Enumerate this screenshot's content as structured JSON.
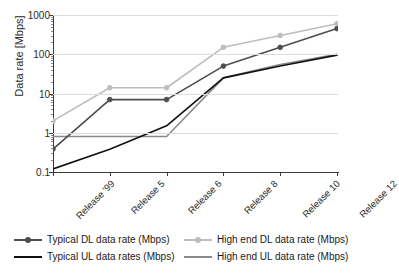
{
  "chart_data": {
    "type": "line",
    "title": "",
    "xlabel": "",
    "ylabel": "Data rate [Mbps]",
    "categories": [
      "Release '99",
      "Release 5",
      "Release 6",
      "Release 8",
      "Release 10",
      "Release 12"
    ],
    "yscale": "log",
    "ylim": [
      0.1,
      1000
    ],
    "yticks": [
      0.1,
      1,
      10,
      100,
      1000
    ],
    "ytick_labels": [
      "0.1",
      "1",
      "10",
      "100",
      "1000"
    ],
    "grid": true,
    "legend_position": "below",
    "series": [
      {
        "name": "Typical DL data rate (Mbps)",
        "color": "#4d4d4d",
        "marker": "circle",
        "values": [
          0.384,
          7,
          7,
          50,
          150,
          450
        ]
      },
      {
        "name": "Typical UL data rates (Mbps)",
        "color": "#111111",
        "marker": "none",
        "values": [
          0.12,
          0.38,
          1.5,
          25,
          50,
          95
        ]
      },
      {
        "name": "High end DL data rate (Mbps)",
        "color": "#bdbdbd",
        "marker": "circle",
        "values": [
          2,
          14,
          14,
          150,
          300,
          600
        ]
      },
      {
        "name": "High end UL data rate (Mbps)",
        "color": "#8a8a8a",
        "marker": "none",
        "values": [
          0.8,
          0.8,
          0.8,
          25,
          55,
          100
        ]
      }
    ]
  },
  "legend": {
    "items": [
      {
        "label": "Typical DL data rate (Mbps)",
        "color": "#4d4d4d",
        "marker": true
      },
      {
        "label": "High end DL data rate (Mbps)",
        "color": "#bdbdbd",
        "marker": true
      },
      {
        "label": "Typical UL data rates (Mbps)",
        "color": "#111111",
        "marker": false
      },
      {
        "label": "High end UL data rate (Mbps)",
        "color": "#8a8a8a",
        "marker": false
      }
    ]
  },
  "caption": ""
}
